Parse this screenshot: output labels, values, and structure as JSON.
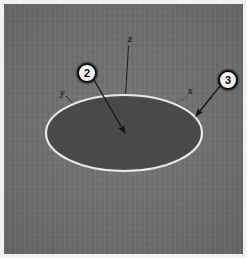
{
  "figure": {
    "background_color": "#6f6f6f",
    "border_color": "#f2f2f2"
  },
  "axes": [
    {
      "name": "z-axis-label",
      "label": "z",
      "x": 124,
      "y": 30
    },
    {
      "name": "y-axis-label",
      "label": "y",
      "x": 56,
      "y": 84
    },
    {
      "name": "x-axis-label",
      "label": "x",
      "x": 184,
      "y": 82
    }
  ],
  "callouts": [
    {
      "name": "callout-marker-2",
      "label": "2",
      "circle_x": 73,
      "circle_y": 59,
      "arrow_from_x": 90,
      "arrow_from_y": 76,
      "arrow_to_x": 121,
      "arrow_to_y": 129,
      "target": "ellipse-center"
    },
    {
      "name": "callout-marker-3",
      "label": "3",
      "circle_x": 214,
      "circle_y": 66,
      "arrow_from_x": 216,
      "arrow_from_y": 82,
      "arrow_to_x": 192,
      "arrow_to_y": 112,
      "target": "ellipse-edge"
    }
  ],
  "ellipse": {
    "name": "annotated-ellipse",
    "center_x": 120,
    "center_y": 129,
    "radius_x": 78,
    "radius_y": 38,
    "fill_color": "#4d4d4d",
    "stroke_color": "#e8e8e4",
    "stroke_width": 2
  },
  "colors": {
    "callout_fill": "#f4f4f4",
    "callout_ring": "#0d0d0d",
    "leader_line": "#141414",
    "axis_line": "#2a2a2a"
  }
}
